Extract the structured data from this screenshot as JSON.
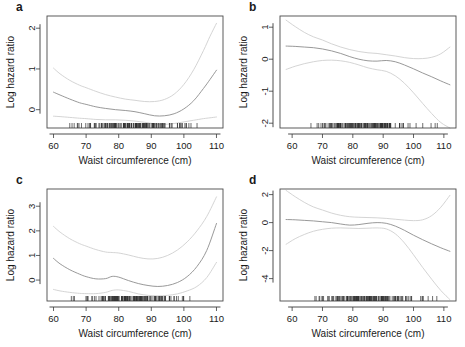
{
  "figure": {
    "axis_title_x": "Waist circumference (cm)",
    "axis_title_y": "Log hazard ratio",
    "colors": {
      "fit_line": "#8d8d8d",
      "ci_line": "#cfcfcf",
      "frame": "#4a4a4a",
      "text": "#1a1a1a"
    }
  },
  "panels": {
    "a": {
      "label": "a"
    },
    "b": {
      "label": "b"
    },
    "c": {
      "label": "c"
    },
    "d": {
      "label": "d"
    }
  },
  "chart_data": [
    {
      "id": "a",
      "type": "line",
      "title": "a",
      "xlabel": "Waist circumference (cm)",
      "ylabel": "Log hazard ratio",
      "xlim": [
        58,
        112
      ],
      "ylim": [
        -0.45,
        2.3
      ],
      "xticks": [
        60,
        70,
        80,
        90,
        100,
        110
      ],
      "yticks": [
        0,
        1,
        2
      ],
      "grid": false,
      "legend": "none",
      "x": [
        60,
        62,
        65,
        68,
        70,
        73,
        76,
        79,
        82,
        85,
        88,
        91,
        94,
        97,
        100,
        103,
        106,
        108,
        110
      ],
      "series": [
        {
          "name": "Upper 95% CI",
          "style": "ci",
          "values": [
            1.02,
            0.88,
            0.72,
            0.6,
            0.54,
            0.45,
            0.37,
            0.31,
            0.26,
            0.23,
            0.2,
            0.2,
            0.25,
            0.38,
            0.62,
            0.98,
            1.45,
            1.8,
            2.12
          ]
        },
        {
          "name": "Smoothed fit",
          "style": "fit",
          "values": [
            0.43,
            0.36,
            0.26,
            0.17,
            0.13,
            0.07,
            0.03,
            0.0,
            -0.02,
            -0.05,
            -0.1,
            -0.15,
            -0.15,
            -0.1,
            0.02,
            0.22,
            0.52,
            0.74,
            0.97
          ]
        },
        {
          "name": "Lower 95% CI",
          "style": "ci",
          "values": [
            -0.16,
            -0.17,
            -0.19,
            -0.21,
            -0.22,
            -0.24,
            -0.25,
            -0.25,
            -0.26,
            -0.28,
            -0.31,
            -0.35,
            -0.36,
            -0.34,
            -0.3,
            -0.26,
            -0.22,
            -0.2,
            -0.18
          ]
        }
      ],
      "rug": true
    },
    {
      "id": "b",
      "type": "line",
      "title": "b",
      "xlabel": "Waist circumference (cm)",
      "ylabel": "Log hazard ratio",
      "xlim": [
        56,
        114
      ],
      "ylim": [
        -2.15,
        1.35
      ],
      "xticks": [
        60,
        70,
        80,
        90,
        100,
        110
      ],
      "yticks": [
        -2,
        -1,
        0,
        1
      ],
      "grid": false,
      "legend": "none",
      "x": [
        58,
        61,
        64,
        67,
        70,
        73,
        76,
        79,
        82,
        85,
        88,
        91,
        94,
        97,
        100,
        103,
        106,
        109,
        112
      ],
      "series": [
        {
          "name": "Upper 95% CI",
          "style": "ci",
          "values": [
            1.22,
            1.02,
            0.84,
            0.7,
            0.6,
            0.48,
            0.38,
            0.3,
            0.24,
            0.2,
            0.18,
            0.14,
            0.1,
            0.05,
            0.02,
            0.02,
            0.06,
            0.17,
            0.38
          ]
        },
        {
          "name": "Smoothed fit",
          "style": "fit",
          "values": [
            0.41,
            0.4,
            0.38,
            0.36,
            0.32,
            0.26,
            0.18,
            0.08,
            0.0,
            -0.05,
            -0.06,
            -0.04,
            -0.08,
            -0.18,
            -0.3,
            -0.43,
            -0.55,
            -0.68,
            -0.8
          ]
        },
        {
          "name": "Lower 95% CI",
          "style": "ci",
          "values": [
            -0.32,
            -0.22,
            -0.14,
            -0.08,
            -0.04,
            -0.03,
            -0.05,
            -0.1,
            -0.18,
            -0.27,
            -0.33,
            -0.38,
            -0.52,
            -0.75,
            -1.05,
            -1.38,
            -1.7,
            -1.98,
            -2.15
          ]
        }
      ],
      "rug": true
    },
    {
      "id": "c",
      "type": "line",
      "title": "c",
      "xlabel": "Waist circumference (cm)",
      "ylabel": "Log hazard ratio",
      "xlim": [
        58,
        112
      ],
      "ylim": [
        -0.85,
        3.7
      ],
      "xticks": [
        60,
        70,
        80,
        90,
        100,
        110
      ],
      "yticks": [
        0,
        1,
        2,
        3
      ],
      "grid": false,
      "legend": "none",
      "x": [
        60,
        62,
        65,
        68,
        70,
        73,
        76,
        78,
        80,
        83,
        86,
        89,
        92,
        95,
        98,
        101,
        104,
        107,
        110
      ],
      "series": [
        {
          "name": "Upper 95% CI",
          "style": "ci",
          "values": [
            2.18,
            1.95,
            1.68,
            1.48,
            1.38,
            1.24,
            1.14,
            1.12,
            1.1,
            1.02,
            0.92,
            0.86,
            0.88,
            1.0,
            1.22,
            1.55,
            2.0,
            2.58,
            3.38
          ]
        },
        {
          "name": "Smoothed fit",
          "style": "fit",
          "values": [
            0.88,
            0.66,
            0.42,
            0.24,
            0.14,
            0.05,
            0.06,
            0.15,
            0.12,
            -0.02,
            -0.14,
            -0.22,
            -0.26,
            -0.22,
            -0.1,
            0.14,
            0.55,
            1.2,
            2.3
          ]
        },
        {
          "name": "Lower 95% CI",
          "style": "ci",
          "values": [
            -0.38,
            -0.44,
            -0.5,
            -0.54,
            -0.55,
            -0.55,
            -0.5,
            -0.42,
            -0.4,
            -0.46,
            -0.56,
            -0.62,
            -0.64,
            -0.62,
            -0.56,
            -0.44,
            -0.26,
            0.1,
            0.72
          ]
        }
      ],
      "rug": true
    },
    {
      "id": "d",
      "type": "line",
      "title": "d",
      "xlabel": "Waist circumference (cm)",
      "ylabel": "Log hazard ratio",
      "xlim": [
        56,
        114
      ],
      "ylim": [
        -5.6,
        2.4
      ],
      "xticks": [
        60,
        70,
        80,
        90,
        100,
        110
      ],
      "yticks": [
        -4,
        -2,
        0,
        2
      ],
      "grid": false,
      "legend": "none",
      "x": [
        58,
        61,
        64,
        67,
        70,
        73,
        76,
        79,
        82,
        85,
        88,
        91,
        94,
        97,
        100,
        103,
        106,
        109,
        112
      ],
      "series": [
        {
          "name": "Upper 95% CI",
          "style": "ci",
          "values": [
            2.3,
            1.85,
            1.45,
            1.12,
            0.9,
            0.68,
            0.52,
            0.42,
            0.38,
            0.36,
            0.34,
            0.3,
            0.24,
            0.18,
            0.14,
            0.2,
            0.5,
            1.1,
            1.95
          ]
        },
        {
          "name": "Smoothed fit",
          "style": "fit",
          "values": [
            0.22,
            0.2,
            0.16,
            0.12,
            0.06,
            0.0,
            -0.1,
            -0.18,
            -0.14,
            -0.05,
            0.0,
            -0.05,
            -0.25,
            -0.55,
            -0.9,
            -1.22,
            -1.52,
            -1.8,
            -2.05
          ]
        },
        {
          "name": "Lower 95% CI",
          "style": "ci",
          "values": [
            -1.55,
            -1.15,
            -0.85,
            -0.62,
            -0.48,
            -0.4,
            -0.38,
            -0.4,
            -0.42,
            -0.4,
            -0.38,
            -0.45,
            -0.8,
            -1.45,
            -2.3,
            -3.2,
            -4.05,
            -4.85,
            -5.5
          ]
        }
      ],
      "rug": true
    }
  ]
}
